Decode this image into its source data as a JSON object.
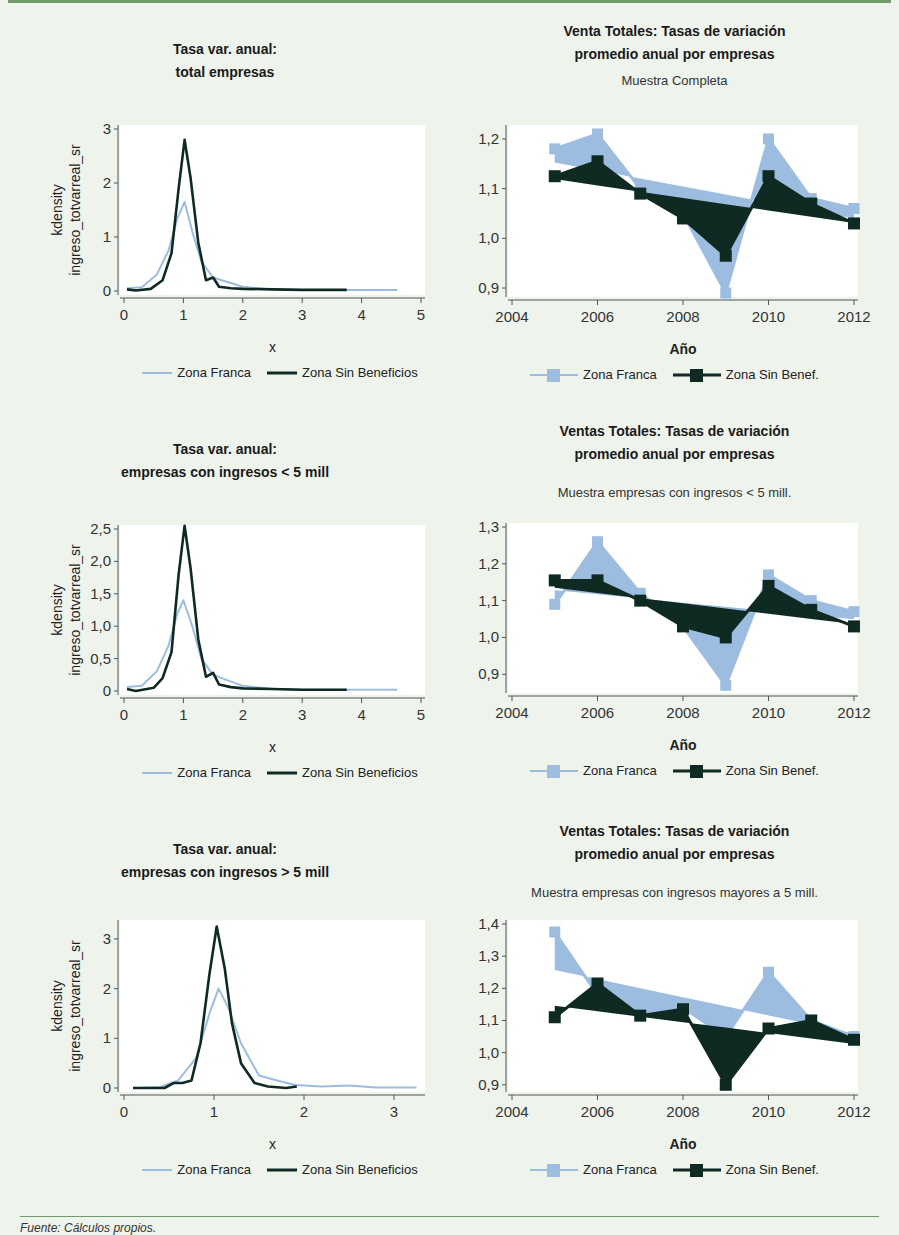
{
  "footer": {
    "source": "Fuente: Cálculos propios."
  },
  "colors": {
    "zona_franca": "#9dbde0",
    "zona_sin_beneficios": "#0f2a22",
    "background": "#eef3ec",
    "rule": "#6f9a6a"
  },
  "panels": {
    "kd1": {
      "title1": "Tasa var. anual:",
      "title2": "total empresas",
      "ylabel1": "kdensity",
      "ylabel2": "ingreso_totvarreal_sr",
      "xlabel": "x",
      "legend": [
        "Zona Franca",
        "Zona Sin Beneficios"
      ]
    },
    "kd2": {
      "title1": "Tasa var. anual:",
      "title2": "empresas con ingresos < 5 mill",
      "ylabel1": "kdensity",
      "ylabel2": "ingreso_totvarreal_sr",
      "xlabel": "x",
      "legend": [
        "Zona Franca",
        "Zona Sin Beneficios"
      ]
    },
    "kd3": {
      "title1": "Tasa var. anual:",
      "title2": "empresas con ingresos > 5 mill",
      "ylabel1": "kdensity",
      "ylabel2": "ingreso_totvarreal_sr",
      "xlabel": "x",
      "legend": [
        "Zona Franca",
        "Zona Sin Beneficios"
      ]
    },
    "ts1": {
      "title1": "Venta Totales: Tasas de variación",
      "title2": "promedio anual por empresas",
      "subtitle": "Muestra Completa",
      "xlabel": "Año",
      "legend": [
        "Zona Franca",
        "Zona Sin Benef."
      ]
    },
    "ts2": {
      "title1": "Ventas Totales: Tasas de variación",
      "title2": "promedio anual por empresas",
      "subtitle": "Muestra empresas con ingresos < 5 mill.",
      "xlabel": "Año",
      "legend": [
        "Zona Franca",
        "Zona Sin Benef."
      ]
    },
    "ts3": {
      "title1": "Ventas Totales: Tasas de variación",
      "title2": "promedio anual por empresas",
      "subtitle": "Muestra empresas con ingresos mayores a 5 mill.",
      "xlabel": "Año",
      "legend": [
        "Zona Franca",
        "Zona Sin Benef."
      ]
    }
  },
  "chart_data": [
    {
      "id": "kd1",
      "type": "line",
      "title": "Tasa var. anual: total empresas",
      "xlabel": "x",
      "ylabel": "kdensity ingreso_totvarreal_sr",
      "xlim": [
        0,
        5
      ],
      "ylim": [
        0,
        3
      ],
      "xticks": [
        "0",
        "1",
        "2",
        "3",
        "4",
        "5"
      ],
      "yticks": [
        "0",
        "1",
        "2",
        "3"
      ],
      "legend_position": "bottom",
      "series": [
        {
          "name": "Zona Franca",
          "x": [
            0.05,
            0.3,
            0.55,
            0.75,
            0.9,
            1.02,
            1.15,
            1.3,
            1.5,
            1.7,
            2.0,
            2.5,
            3.0,
            3.5,
            4.0,
            4.6
          ],
          "y": [
            0.05,
            0.07,
            0.3,
            0.75,
            1.35,
            1.65,
            1.1,
            0.55,
            0.25,
            0.18,
            0.08,
            0.03,
            0.02,
            0.02,
            0.02,
            0.02
          ]
        },
        {
          "name": "Zona Sin Beneficios",
          "x": [
            0.05,
            0.2,
            0.45,
            0.65,
            0.8,
            0.92,
            1.02,
            1.12,
            1.25,
            1.38,
            1.5,
            1.6,
            1.8,
            2.0,
            2.5,
            3.0,
            3.5,
            3.75
          ],
          "y": [
            0.03,
            0.01,
            0.04,
            0.2,
            0.7,
            1.9,
            2.8,
            2.1,
            0.9,
            0.2,
            0.25,
            0.08,
            0.05,
            0.04,
            0.03,
            0.02,
            0.02,
            0.02
          ]
        }
      ]
    },
    {
      "id": "kd2",
      "type": "line",
      "title": "Tasa var. anual: empresas con ingresos < 5 mill",
      "xlabel": "x",
      "ylabel": "kdensity ingreso_totvarreal_sr",
      "xlim": [
        0,
        5
      ],
      "ylim": [
        0,
        2.5
      ],
      "xticks": [
        "0",
        "1",
        "2",
        "3",
        "4",
        "5"
      ],
      "yticks": [
        "0",
        "0,5",
        "1,0",
        "1,5",
        "2,0",
        "2,5"
      ],
      "legend_position": "bottom",
      "series": [
        {
          "name": "Zona Franca",
          "x": [
            0.05,
            0.3,
            0.55,
            0.75,
            0.9,
            1.0,
            1.15,
            1.3,
            1.5,
            1.7,
            2.0,
            2.5,
            3.0,
            3.5,
            4.0,
            4.6
          ],
          "y": [
            0.06,
            0.08,
            0.3,
            0.7,
            1.2,
            1.4,
            1.0,
            0.5,
            0.25,
            0.18,
            0.08,
            0.03,
            0.02,
            0.02,
            0.02,
            0.02
          ]
        },
        {
          "name": "Zona Sin Beneficios",
          "x": [
            0.05,
            0.2,
            0.5,
            0.65,
            0.8,
            0.92,
            1.02,
            1.12,
            1.25,
            1.38,
            1.5,
            1.6,
            1.8,
            2.0,
            2.5,
            3.0,
            3.5,
            3.75
          ],
          "y": [
            0.03,
            0.0,
            0.05,
            0.2,
            0.6,
            1.8,
            2.55,
            1.9,
            0.8,
            0.22,
            0.28,
            0.1,
            0.06,
            0.04,
            0.03,
            0.02,
            0.02,
            0.02
          ]
        }
      ]
    },
    {
      "id": "kd3",
      "type": "line",
      "title": "Tasa var. anual: empresas con ingresos > 5 mill",
      "xlabel": "x",
      "ylabel": "kdensity ingreso_totvarreal_sr",
      "xlim": [
        0,
        3.3
      ],
      "ylim": [
        0,
        3.3
      ],
      "xticks": [
        "0",
        "1",
        "2",
        "3"
      ],
      "yticks": [
        "0",
        "1",
        "2",
        "3"
      ],
      "legend_position": "bottom",
      "series": [
        {
          "name": "Zona Franca",
          "x": [
            0.1,
            0.4,
            0.6,
            0.8,
            0.95,
            1.05,
            1.15,
            1.3,
            1.5,
            1.7,
            1.9,
            2.2,
            2.5,
            2.8,
            3.25
          ],
          "y": [
            0.0,
            0.02,
            0.15,
            0.6,
            1.5,
            2.0,
            1.65,
            0.9,
            0.25,
            0.15,
            0.06,
            0.03,
            0.05,
            0.01,
            0.01
          ]
        },
        {
          "name": "Zona Sin Beneficios",
          "x": [
            0.1,
            0.2,
            0.45,
            0.55,
            0.65,
            0.75,
            0.85,
            0.95,
            1.03,
            1.12,
            1.2,
            1.3,
            1.45,
            1.6,
            1.8,
            1.92
          ],
          "y": [
            0.0,
            0.0,
            0.0,
            0.1,
            0.1,
            0.15,
            0.9,
            2.3,
            3.25,
            2.4,
            1.3,
            0.5,
            0.1,
            0.03,
            0.0,
            0.03
          ]
        }
      ]
    },
    {
      "id": "ts1",
      "type": "line",
      "title": "Venta Totales: Tasas de variación promedio anual por empresas",
      "subtitle": "Muestra Completa",
      "xlabel": "Año",
      "ylabel": "",
      "xlim": [
        2004,
        2012
      ],
      "ylim": [
        0.89,
        1.22
      ],
      "xticks": [
        "2004",
        "2006",
        "2008",
        "2010",
        "2012"
      ],
      "yticks": [
        "0,9",
        "1,0",
        "1,1",
        "1,2"
      ],
      "legend_position": "bottom",
      "categories": [
        2005,
        2006,
        2007,
        2008,
        2009,
        2010,
        2011,
        2012
      ],
      "series": [
        {
          "name": "Zona Franca",
          "values": [
            1.18,
            1.21,
            1.1,
            1.05,
            0.89,
            1.2,
            1.08,
            1.06
          ]
        },
        {
          "name": "Zona Sin Benef.",
          "values": [
            1.125,
            1.155,
            1.09,
            1.04,
            0.965,
            1.125,
            1.07,
            1.03
          ]
        }
      ]
    },
    {
      "id": "ts2",
      "type": "line",
      "title": "Ventas Totales: Tasas de variación promedio anual por empresas",
      "subtitle": "Muestra empresas con ingresos < 5 mill.",
      "xlabel": "Año",
      "ylabel": "",
      "xlim": [
        2004,
        2012
      ],
      "ylim": [
        0.86,
        1.3
      ],
      "xticks": [
        "2004",
        "2006",
        "2008",
        "2010",
        "2012"
      ],
      "yticks": [
        "0,9",
        "1,0",
        "1,1",
        "1,2",
        "1,3"
      ],
      "legend_position": "bottom",
      "categories": [
        2005,
        2006,
        2007,
        2008,
        2009,
        2010,
        2011,
        2012
      ],
      "series": [
        {
          "name": "Zona Franca",
          "values": [
            1.09,
            1.26,
            1.12,
            1.03,
            0.87,
            1.17,
            1.1,
            1.07
          ]
        },
        {
          "name": "Zona Sin Benef.",
          "values": [
            1.155,
            1.155,
            1.1,
            1.03,
            1.0,
            1.14,
            1.075,
            1.03
          ]
        }
      ]
    },
    {
      "id": "ts3",
      "type": "line",
      "title": "Ventas Totales: Tasas de variación promedio anual por empresas",
      "subtitle": "Muestra empresas con ingresos mayores a 5 mill.",
      "xlabel": "Año",
      "ylabel": "",
      "xlim": [
        2004,
        2012
      ],
      "ylim": [
        0.89,
        1.4
      ],
      "xticks": [
        "2004",
        "2006",
        "2008",
        "2010",
        "2012"
      ],
      "yticks": [
        "0,9",
        "1,0",
        "1,1",
        "1,2",
        "1,3",
        "1,4"
      ],
      "legend_position": "bottom",
      "categories": [
        2005,
        2006,
        2007,
        2008,
        2009,
        2010,
        2011,
        2012
      ],
      "series": [
        {
          "name": "Zona Franca",
          "values": [
            1.375,
            1.18,
            1.12,
            1.14,
            1.05,
            1.25,
            1.1,
            1.05
          ]
        },
        {
          "name": "Zona Sin Benef.",
          "values": [
            1.11,
            1.215,
            1.115,
            1.135,
            0.9,
            1.075,
            1.1,
            1.04
          ]
        }
      ]
    }
  ]
}
